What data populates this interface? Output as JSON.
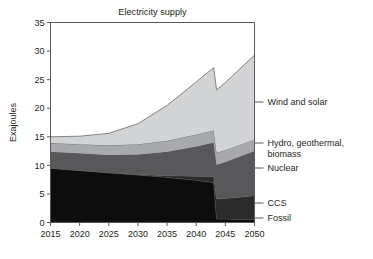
{
  "chart_data": {
    "type": "area",
    "stacked": true,
    "title": "Electricity supply",
    "xlabel": "",
    "ylabel": "Exajoules",
    "xlim": [
      2015,
      2050
    ],
    "ylim": [
      0,
      35
    ],
    "grid": false,
    "legend_position": "right-outside",
    "xticks": [
      2015,
      2020,
      2025,
      2030,
      2035,
      2040,
      2045,
      2050
    ],
    "yticks": [
      0,
      5,
      10,
      15,
      20,
      25,
      30,
      35
    ],
    "x": [
      2015,
      2020,
      2025,
      2030,
      2035,
      2040,
      2043,
      2043.5,
      2045,
      2050
    ],
    "series": [
      {
        "name": "Fossil",
        "color": "#0d0d0d",
        "legend_label": "Fossil",
        "values": [
          9.5,
          9.1,
          8.7,
          8.3,
          7.9,
          7.4,
          7.0,
          0.6,
          0.6,
          0.5
        ]
      },
      {
        "name": "CCS",
        "color": "#2b2b2b",
        "legend_label": "CCS",
        "values": [
          0.0,
          0.0,
          0.0,
          0.1,
          0.3,
          0.7,
          1.0,
          3.5,
          3.6,
          4.2
        ]
      },
      {
        "name": "Nuclear",
        "color": "#58585a",
        "legend_label": "Nuclear",
        "values": [
          2.9,
          3.0,
          3.1,
          3.5,
          4.2,
          5.2,
          6.0,
          6.0,
          6.4,
          7.8
        ]
      },
      {
        "name": "Hydro, geothermal, biomass",
        "color": "#a7a9ac",
        "legend_label": "Hydro, geothermal, biomass",
        "values": [
          1.5,
          1.6,
          1.7,
          1.8,
          1.9,
          2.1,
          2.1,
          2.1,
          2.1,
          2.0
        ]
      },
      {
        "name": "Wind and solar",
        "color": "#d1d3d4",
        "legend_label": "Wind and solar",
        "values": [
          1.1,
          1.4,
          2.1,
          3.6,
          6.2,
          9.2,
          11.0,
          11.0,
          11.8,
          14.8
        ]
      }
    ],
    "totals": [
      15.0,
      15.1,
      15.6,
      17.3,
      20.5,
      24.6,
      27.1,
      23.2,
      24.5,
      29.3
    ]
  },
  "legend": {
    "entries": [
      {
        "label": "Wind and solar"
      },
      {
        "label": "Hydro, geothermal,"
      },
      {
        "label": "biomass"
      },
      {
        "label": "Nuclear"
      },
      {
        "label": "CCS"
      },
      {
        "label": "Fossil"
      }
    ]
  }
}
